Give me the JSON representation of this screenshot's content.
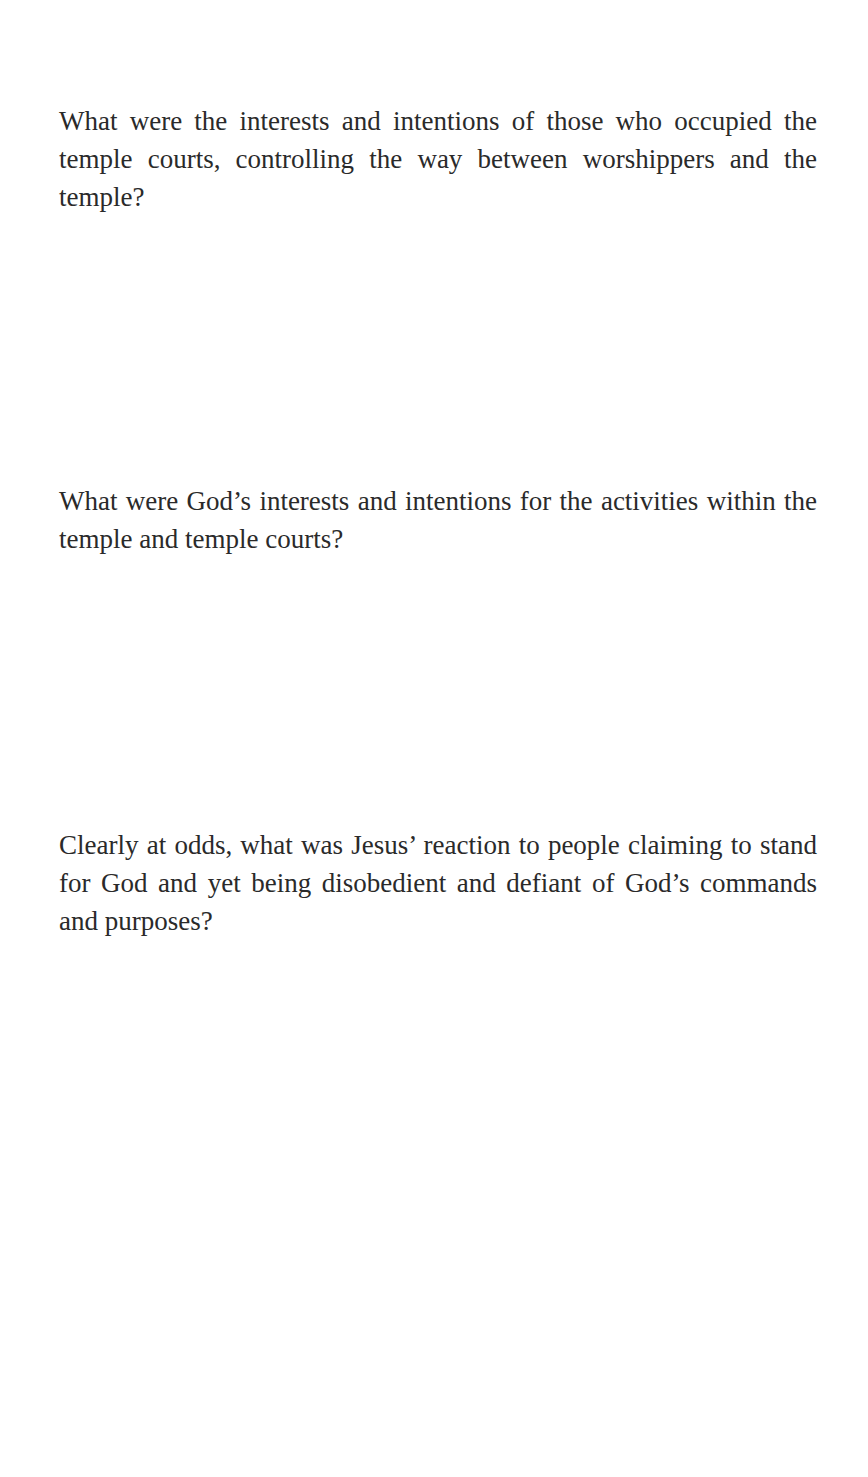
{
  "questions": [
    {
      "text": "What were the interests and intentions of those who occupied the temple courts, controlling the way between worshippers and the temple?"
    },
    {
      "text": "What were God’s interests and intentions for the activities within the temple and temple courts?"
    },
    {
      "text": "Clearly at odds, what was Jesus’ reaction to people claiming to stand for God and yet being disobedient and defiant of God’s commands and purposes?"
    }
  ]
}
